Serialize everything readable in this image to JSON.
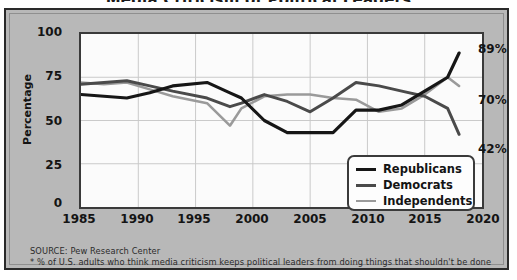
{
  "chart_data": {
    "type": "line",
    "title": "Media Criticism of Political Leaders",
    "xlabel": "",
    "ylabel": "Percentage",
    "xlim": [
      1985,
      2020
    ],
    "ylim": [
      0,
      100
    ],
    "xticks": [
      1985,
      1990,
      1995,
      2000,
      2005,
      2010,
      2015,
      2020
    ],
    "yticks": [
      0,
      25,
      50,
      75,
      100
    ],
    "grid": true,
    "legend_position": "bottom-right",
    "series": [
      {
        "name": "Republicans",
        "color": "#161616",
        "end_label": "89%",
        "x": [
          1985,
          1987,
          1989,
          1991,
          1993,
          1996,
          1998,
          1999,
          2001,
          2003,
          2005,
          2007,
          2009,
          2011,
          2013,
          2015,
          2017,
          2018
        ],
        "values": [
          65,
          64,
          63,
          66,
          70,
          72,
          66,
          63,
          50,
          43,
          43,
          43,
          56,
          56,
          59,
          67,
          75,
          89
        ]
      },
      {
        "name": "Democrats",
        "color": "#4a4a4a",
        "end_label": "42%",
        "x": [
          1985,
          1987,
          1989,
          1991,
          1993,
          1996,
          1998,
          1999,
          2001,
          2003,
          2005,
          2007,
          2009,
          2011,
          2013,
          2015,
          2017,
          2018
        ],
        "values": [
          71,
          72,
          73,
          70,
          67,
          63,
          58,
          60,
          65,
          61,
          55,
          63,
          72,
          70,
          67,
          64,
          57,
          42
        ]
      },
      {
        "name": "Independents",
        "color": "#9a9a9a",
        "end_label": "70%",
        "x": [
          1985,
          1987,
          1989,
          1991,
          1993,
          1996,
          1998,
          1999,
          2001,
          2003,
          2005,
          2007,
          2009,
          2011,
          2013,
          2015,
          2017,
          2018
        ],
        "values": [
          72,
          71,
          72,
          68,
          64,
          60,
          47,
          57,
          64,
          65,
          65,
          63,
          62,
          55,
          57,
          65,
          75,
          70
        ]
      }
    ]
  },
  "axes": {
    "y_title": "Percentage",
    "y_ticks": [
      "100",
      "75",
      "50",
      "25",
      "0"
    ],
    "x_ticks": [
      "1985",
      "1990",
      "1995",
      "2000",
      "2005",
      "2010",
      "2015",
      "2020"
    ]
  },
  "end_labels": {
    "republicans": "89%",
    "independents": "70%",
    "democrats": "42%"
  },
  "legend": {
    "items": [
      {
        "label": "Republicans",
        "color": "#161616",
        "width": "3.6px"
      },
      {
        "label": "Democrats",
        "color": "#4a4a4a",
        "width": "3.2px"
      },
      {
        "label": "Independents",
        "color": "#9a9a9a",
        "width": "2.4px"
      }
    ]
  },
  "footnotes": {
    "source": "SOURCE: Pew Research Center",
    "note": "* % of U.S. adults who think media criticism keeps political leaders from doing things that shouldn't be done"
  }
}
